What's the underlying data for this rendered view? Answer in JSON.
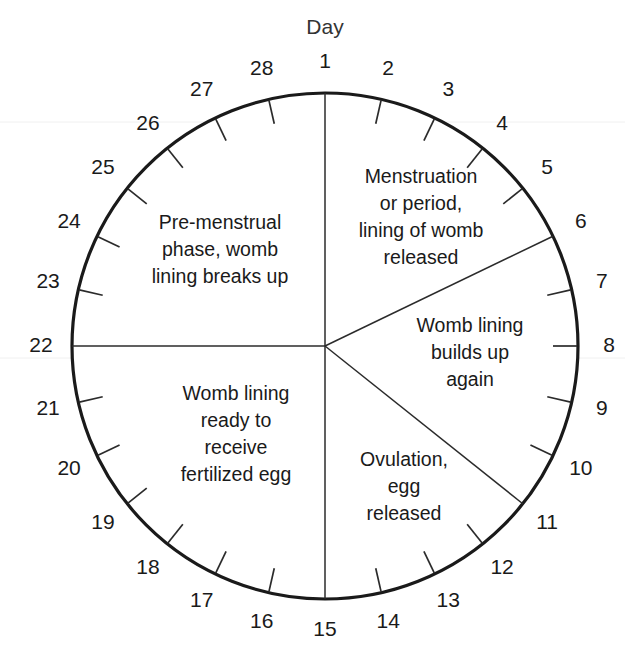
{
  "title": "Day",
  "colors": {
    "circle_stroke": "#1a1a1a",
    "tick_stroke": "#2b2b2b",
    "divider_stroke": "#2b2b2b",
    "text": "#1a1a1a",
    "background": "#ffffff"
  },
  "geometry": {
    "center_x": 325,
    "center_y": 346,
    "radius": 253,
    "label_radius": 284,
    "tick_inner_radius": 228,
    "days_in_cycle": 28
  },
  "days": [
    {
      "n": "1",
      "angle": 0
    },
    {
      "n": "2",
      "angle": 12.857
    },
    {
      "n": "3",
      "angle": 25.714
    },
    {
      "n": "4",
      "angle": 38.571
    },
    {
      "n": "5",
      "angle": 51.429
    },
    {
      "n": "6",
      "angle": 64.286
    },
    {
      "n": "7",
      "angle": 77.143
    },
    {
      "n": "8",
      "angle": 90
    },
    {
      "n": "9",
      "angle": 102.857
    },
    {
      "n": "10",
      "angle": 115.714
    },
    {
      "n": "11",
      "angle": 128.571
    },
    {
      "n": "12",
      "angle": 141.429
    },
    {
      "n": "13",
      "angle": 154.286
    },
    {
      "n": "14",
      "angle": 167.143
    },
    {
      "n": "15",
      "angle": 180
    },
    {
      "n": "16",
      "angle": 192.857
    },
    {
      "n": "17",
      "angle": 205.714
    },
    {
      "n": "18",
      "angle": 218.571
    },
    {
      "n": "19",
      "angle": 231.429
    },
    {
      "n": "20",
      "angle": 244.286
    },
    {
      "n": "21",
      "angle": 257.143
    },
    {
      "n": "22",
      "angle": 270
    },
    {
      "n": "23",
      "angle": 282.857
    },
    {
      "n": "24",
      "angle": 295.714
    },
    {
      "n": "25",
      "angle": 308.571
    },
    {
      "n": "26",
      "angle": 321.429
    },
    {
      "n": "27",
      "angle": 334.286
    },
    {
      "n": "28",
      "angle": 347.143
    }
  ],
  "dividers": [
    {
      "name": "divider-day-1",
      "angle": 0
    },
    {
      "name": "divider-day-6",
      "angle": 64.286
    },
    {
      "name": "divider-day-11",
      "angle": 128.571
    },
    {
      "name": "divider-day-15",
      "angle": 180
    },
    {
      "name": "divider-day-22",
      "angle": 270
    }
  ],
  "phases": [
    {
      "id": "menstruation",
      "name": "Menstruation or period, lining of womb released",
      "lines": [
        "Menstruation",
        "or period,",
        "lining of womb",
        "released"
      ],
      "x": 421,
      "y": 183,
      "line_height": 27,
      "day_range": "1-6"
    },
    {
      "id": "womb-lining-builds",
      "name": "Womb lining builds up again",
      "lines": [
        "Womb lining",
        "builds up",
        "again"
      ],
      "x": 470,
      "y": 332,
      "line_height": 27,
      "day_range": "6-11"
    },
    {
      "id": "ovulation",
      "name": "Ovulation, egg released",
      "lines": [
        "Ovulation,",
        "egg",
        "released"
      ],
      "x": 404,
      "y": 466,
      "line_height": 27,
      "day_range": "11-15"
    },
    {
      "id": "womb-lining-ready",
      "name": "Womb lining ready to receive fertilized egg",
      "lines": [
        "Womb lining",
        "ready to",
        "receive",
        "fertilized egg"
      ],
      "x": 236,
      "y": 400,
      "line_height": 27,
      "day_range": "15-22"
    },
    {
      "id": "pre-menstrual",
      "name": "Pre-menstrual phase, womb lining breaks up",
      "lines": [
        "Pre-menstrual",
        "phase, womb",
        "lining breaks up"
      ],
      "x": 220,
      "y": 229,
      "line_height": 27,
      "day_range": "22-28"
    }
  ]
}
